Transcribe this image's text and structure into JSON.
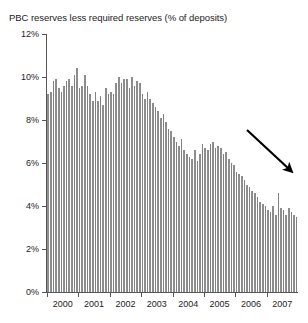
{
  "chart_data": {
    "type": "bar",
    "title": "PBC reserves less required reserves (% of deposits)",
    "xlabel": "",
    "ylabel": "",
    "ylim": [
      0,
      12
    ],
    "ytick_labels": [
      "0%",
      "2%",
      "4%",
      "6%",
      "8%",
      "10%",
      "12%"
    ],
    "ytick_values": [
      0,
      2,
      4,
      6,
      8,
      10,
      12
    ],
    "xtick_labels": [
      "2000",
      "2001",
      "2002",
      "2003",
      "2004",
      "2005",
      "2006",
      "2007"
    ],
    "xtick_values": [
      2000,
      2001,
      2002,
      2003,
      2004,
      2005,
      2006,
      2007
    ],
    "grid": false,
    "legend": null,
    "bar_color": "#8d8d8d",
    "frequency": "monthly",
    "x_start": "2000-01",
    "x_end": "2007-12",
    "annotations": [
      {
        "type": "arrow",
        "label": "downward-trend-arrow",
        "from": [
          247,
          130
        ],
        "to": [
          289,
          169
        ],
        "color": "#000000"
      }
    ],
    "categories": [
      "2000-01",
      "2000-02",
      "2000-03",
      "2000-04",
      "2000-05",
      "2000-06",
      "2000-07",
      "2000-08",
      "2000-09",
      "2000-10",
      "2000-11",
      "2000-12",
      "2001-01",
      "2001-02",
      "2001-03",
      "2001-04",
      "2001-05",
      "2001-06",
      "2001-07",
      "2001-08",
      "2001-09",
      "2001-10",
      "2001-11",
      "2001-12",
      "2002-01",
      "2002-02",
      "2002-03",
      "2002-04",
      "2002-05",
      "2002-06",
      "2002-07",
      "2002-08",
      "2002-09",
      "2002-10",
      "2002-11",
      "2002-12",
      "2003-01",
      "2003-02",
      "2003-03",
      "2003-04",
      "2003-05",
      "2003-06",
      "2003-07",
      "2003-08",
      "2003-09",
      "2003-10",
      "2003-11",
      "2003-12",
      "2004-01",
      "2004-02",
      "2004-03",
      "2004-04",
      "2004-05",
      "2004-06",
      "2004-07",
      "2004-08",
      "2004-09",
      "2004-10",
      "2004-11",
      "2004-12",
      "2005-01",
      "2005-02",
      "2005-03",
      "2005-04",
      "2005-05",
      "2005-06",
      "2005-07",
      "2005-08",
      "2005-09",
      "2005-10",
      "2005-11",
      "2005-12",
      "2006-01",
      "2006-02",
      "2006-03",
      "2006-04",
      "2006-05",
      "2006-06",
      "2006-07",
      "2006-08",
      "2006-09",
      "2006-10",
      "2006-11",
      "2006-12",
      "2007-01",
      "2007-02",
      "2007-03",
      "2007-04",
      "2007-05",
      "2007-06",
      "2007-07",
      "2007-08",
      "2007-09",
      "2007-10",
      "2007-11",
      "2007-12"
    ],
    "values": [
      9.2,
      9.3,
      9.8,
      9.9,
      9.5,
      9.3,
      9.6,
      9.8,
      9.9,
      9.6,
      10.1,
      10.4,
      9.5,
      9.6,
      10.1,
      9.6,
      9.2,
      8.9,
      9.3,
      8.9,
      9.1,
      8.7,
      9.5,
      9.2,
      9.3,
      9.2,
      9.7,
      10.0,
      9.7,
      9.9,
      9.9,
      9.5,
      10.0,
      9.6,
      9.8,
      9.7,
      9.2,
      9.0,
      9.3,
      9.0,
      8.8,
      8.6,
      8.4,
      8.1,
      8.3,
      7.9,
      7.6,
      7.5,
      7.2,
      7.0,
      6.8,
      7.1,
      6.6,
      6.4,
      6.3,
      6.2,
      6.6,
      6.1,
      6.4,
      6.9,
      6.7,
      6.6,
      6.9,
      7.0,
      6.7,
      6.8,
      6.7,
      6.4,
      6.5,
      6.2,
      6.0,
      5.9,
      5.6,
      5.5,
      5.4,
      5.2,
      5.0,
      4.9,
      4.7,
      4.6,
      4.4,
      4.2,
      4.1,
      4.0,
      3.8,
      3.7,
      4.0,
      3.6,
      4.6,
      3.9,
      3.8,
      3.6,
      3.9,
      3.7,
      3.6,
      3.5
    ]
  }
}
